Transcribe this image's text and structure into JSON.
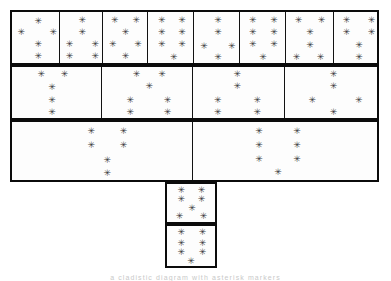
{
  "figure": {
    "title": "",
    "caption_fragment": "a cladistic diagram with asterisk markers",
    "star_glyph": "✳",
    "colors": {
      "border": "#0b0b0b",
      "star": "#3a3a3a",
      "background": "#ffffff",
      "cell_fill": "#fdfdfd"
    }
  },
  "chart_data": {
    "type": "diagram",
    "title": "",
    "rows": [
      {
        "name": "row-1",
        "x": 10,
        "y": 10,
        "w": 369,
        "h": 55,
        "cells": [
          {
            "name": "r1c1",
            "x": 0,
            "w": 47,
            "stars": [
              [
                0.56,
                0.18
              ],
              [
                0.2,
                0.4
              ],
              [
                0.88,
                0.4
              ],
              [
                0.56,
                0.62
              ],
              [
                0.56,
                0.86
              ]
            ]
          },
          {
            "name": "r1c2",
            "x": 47,
            "w": 43,
            "stars": [
              [
                0.52,
                0.16
              ],
              [
                0.52,
                0.4
              ],
              [
                0.22,
                0.63
              ],
              [
                0.82,
                0.63
              ],
              [
                0.22,
                0.86
              ],
              [
                0.82,
                0.86
              ]
            ]
          },
          {
            "name": "r1c3",
            "x": 90,
            "w": 45,
            "stars": [
              [
                0.26,
                0.16
              ],
              [
                0.74,
                0.16
              ],
              [
                0.5,
                0.4
              ],
              [
                0.22,
                0.63
              ],
              [
                0.78,
                0.63
              ],
              [
                0.5,
                0.86
              ]
            ]
          },
          {
            "name": "r1c4",
            "x": 135,
            "w": 46,
            "stars": [
              [
                0.3,
                0.16
              ],
              [
                0.74,
                0.16
              ],
              [
                0.3,
                0.4
              ],
              [
                0.74,
                0.4
              ],
              [
                0.3,
                0.63
              ],
              [
                0.74,
                0.63
              ],
              [
                0.56,
                0.88
              ]
            ]
          },
          {
            "name": "r1c5",
            "x": 181,
            "w": 46,
            "stars": [
              [
                0.52,
                0.16
              ],
              [
                0.52,
                0.4
              ],
              [
                0.22,
                0.66
              ],
              [
                0.82,
                0.66
              ],
              [
                0.52,
                0.88
              ]
            ]
          },
          {
            "name": "r1c6",
            "x": 227,
            "w": 46,
            "stars": [
              [
                0.28,
                0.16
              ],
              [
                0.74,
                0.16
              ],
              [
                0.28,
                0.4
              ],
              [
                0.74,
                0.4
              ],
              [
                0.28,
                0.63
              ],
              [
                0.74,
                0.63
              ],
              [
                0.5,
                0.88
              ]
            ]
          },
          {
            "name": "r1c7",
            "x": 273,
            "w": 48,
            "stars": [
              [
                0.26,
                0.16
              ],
              [
                0.74,
                0.16
              ],
              [
                0.5,
                0.4
              ],
              [
                0.5,
                0.64
              ],
              [
                0.22,
                0.88
              ],
              [
                0.72,
                0.88
              ]
            ]
          },
          {
            "name": "r1c8",
            "x": 321,
            "w": 48,
            "stars": [
              [
                0.26,
                0.16
              ],
              [
                0.78,
                0.16
              ],
              [
                0.26,
                0.4
              ],
              [
                0.78,
                0.4
              ],
              [
                0.52,
                0.64
              ],
              [
                0.52,
                0.88
              ]
            ]
          }
        ]
      },
      {
        "name": "row-2",
        "x": 10,
        "y": 65,
        "w": 369,
        "h": 55,
        "cells": [
          {
            "name": "r2c1",
            "x": 0,
            "w": 89,
            "stars": [
              [
                0.33,
                0.14
              ],
              [
                0.59,
                0.14
              ],
              [
                0.45,
                0.4
              ],
              [
                0.45,
                0.64
              ],
              [
                0.45,
                0.88
              ]
            ]
          },
          {
            "name": "r2c2",
            "x": 89,
            "w": 91,
            "stars": [
              [
                0.38,
                0.14
              ],
              [
                0.66,
                0.14
              ],
              [
                0.52,
                0.38
              ],
              [
                0.31,
                0.64
              ],
              [
                0.72,
                0.64
              ],
              [
                0.31,
                0.88
              ],
              [
                0.72,
                0.88
              ]
            ]
          },
          {
            "name": "r2c3",
            "x": 180,
            "w": 92,
            "stars": [
              [
                0.48,
                0.14
              ],
              [
                0.48,
                0.38
              ],
              [
                0.27,
                0.64
              ],
              [
                0.7,
                0.64
              ],
              [
                0.27,
                0.88
              ],
              [
                0.7,
                0.88
              ]
            ]
          },
          {
            "name": "r2c4",
            "x": 272,
            "w": 97,
            "stars": [
              [
                0.5,
                0.14
              ],
              [
                0.5,
                0.38
              ],
              [
                0.28,
                0.64
              ],
              [
                0.76,
                0.64
              ],
              [
                0.5,
                0.88
              ]
            ]
          }
        ]
      },
      {
        "name": "row-3",
        "x": 10,
        "y": 120,
        "w": 369,
        "h": 62,
        "cells": [
          {
            "name": "r3c1",
            "x": 0,
            "w": 180,
            "stars": [
              [
                0.44,
                0.16
              ],
              [
                0.62,
                0.16
              ],
              [
                0.44,
                0.4
              ],
              [
                0.62,
                0.4
              ],
              [
                0.53,
                0.65
              ],
              [
                0.53,
                0.88
              ]
            ]
          },
          {
            "name": "r3c2",
            "x": 180,
            "w": 189,
            "stars": [
              [
                0.35,
                0.16
              ],
              [
                0.55,
                0.16
              ],
              [
                0.35,
                0.4
              ],
              [
                0.55,
                0.4
              ],
              [
                0.35,
                0.64
              ],
              [
                0.55,
                0.64
              ],
              [
                0.45,
                0.86
              ]
            ]
          }
        ]
      }
    ],
    "leaves": [
      {
        "name": "leaf-1",
        "x": 165,
        "y": 182,
        "w": 52,
        "h": 42,
        "stars": [
          [
            0.3,
            0.16
          ],
          [
            0.72,
            0.16
          ],
          [
            0.3,
            0.4
          ],
          [
            0.72,
            0.4
          ],
          [
            0.52,
            0.62
          ],
          [
            0.26,
            0.84
          ],
          [
            0.76,
            0.84
          ]
        ]
      },
      {
        "name": "leaf-2",
        "x": 165,
        "y": 224,
        "w": 52,
        "h": 44,
        "stars": [
          [
            0.3,
            0.16
          ],
          [
            0.74,
            0.16
          ],
          [
            0.3,
            0.42
          ],
          [
            0.74,
            0.42
          ],
          [
            0.3,
            0.66
          ],
          [
            0.74,
            0.66
          ],
          [
            0.5,
            0.88
          ]
        ]
      }
    ]
  }
}
